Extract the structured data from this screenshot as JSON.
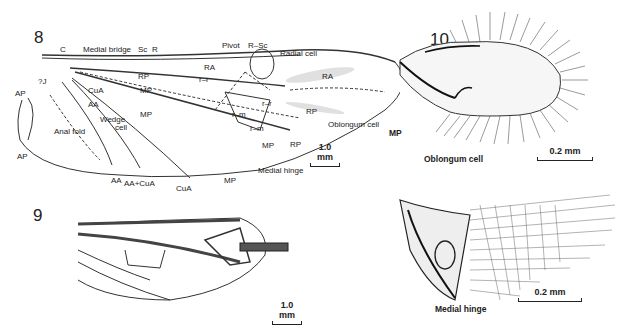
{
  "figures": [
    {
      "number": "8",
      "labels": {
        "c": "C",
        "medial_bridge": "Medial bridge",
        "sc": "Sc",
        "r": "R",
        "pivot": "Pivot",
        "r_sc": "R–Sc",
        "radial_cell": "Radial cell",
        "ra_top": "RA",
        "ra_right": "RA",
        "rp_top": "RP",
        "rp_right": "RP",
        "rp_bottom": "RP",
        "r_r_1": "r–r",
        "r_r_2": "r–r",
        "r_m_1": "r–m",
        "r_m_2": "r–m",
        "mp_1": "MP",
        "mp_2": "MP",
        "mp_3": "MP",
        "mp_bottom": "MP",
        "q_j": "?J",
        "ap_top": "AP",
        "ap_bottom": "AP",
        "cua": "CuA",
        "cua_bottom": "CuA",
        "aa": "AA",
        "aa_bottom": "AA",
        "aa_cua": "AA+CuA",
        "wedge_cell_1": "Wedge",
        "wedge_cell_2": "cell",
        "anal_fold": "Anal fold",
        "oblongum_cell": "Oblongum cell",
        "medial_hinge": "Medial hinge"
      },
      "scale_bar": "1.0 mm"
    },
    {
      "number": "9",
      "scale_bar": "1.0 mm"
    },
    {
      "number": "10",
      "labels": {
        "mp": "MP",
        "oblongum_cell": "Oblongum cell"
      },
      "scale_bar": "0.2 mm"
    },
    {
      "number": "11",
      "labels": {
        "medial_hinge": "Medial hinge"
      },
      "scale_bar": "0.2 mm"
    }
  ]
}
